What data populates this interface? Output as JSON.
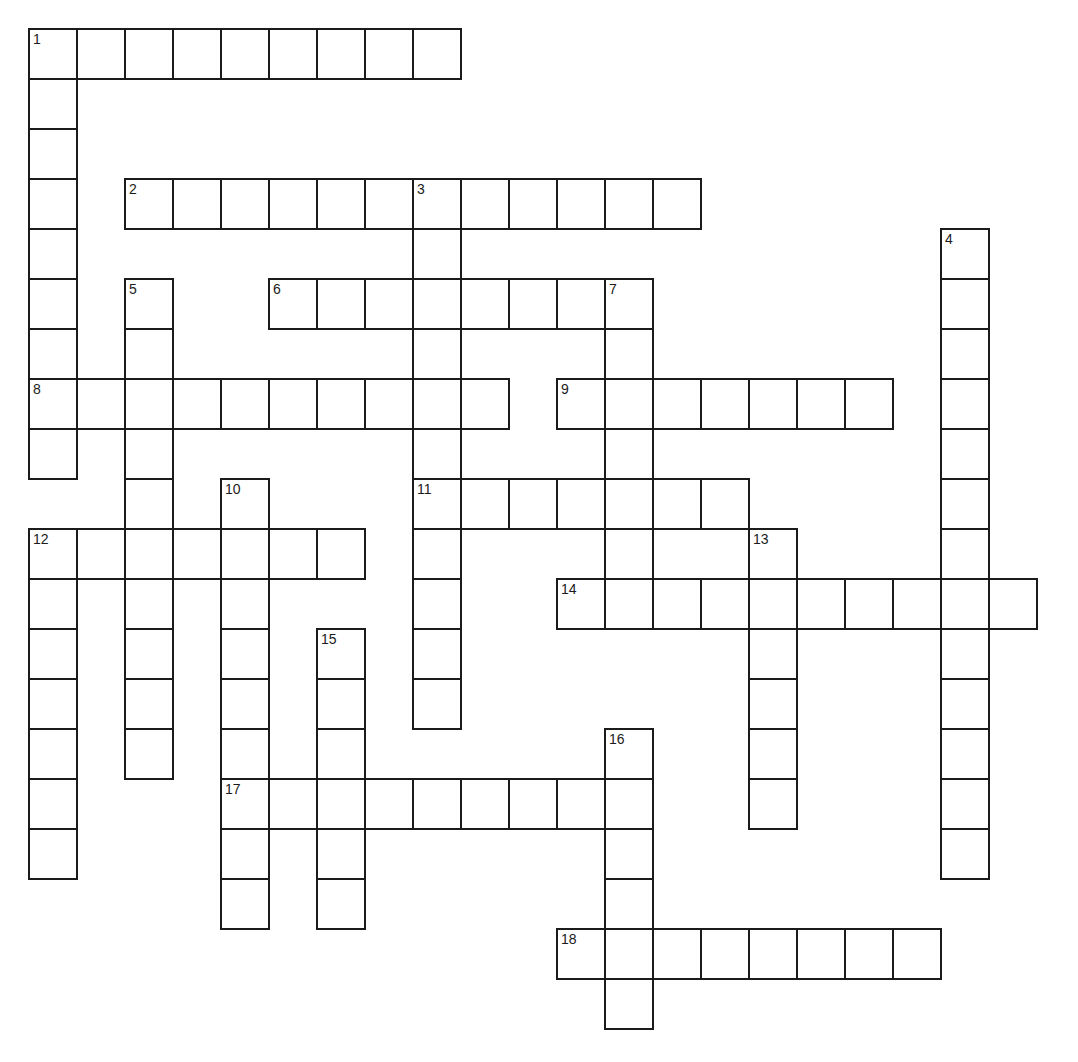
{
  "puzzle": {
    "kind": "crossword",
    "background": "#ffffff",
    "line_color": "#1b1b1b",
    "number_color": "#1b1b1b"
  },
  "grid": {
    "origin_x": 28,
    "origin_y": 28,
    "cell_width": 48,
    "cell_height": 50,
    "line_width": 2,
    "columns": 21,
    "rows": 20
  },
  "words": [
    {
      "num": 1,
      "dir": "across",
      "col": 0,
      "row": 0,
      "len": 9
    },
    {
      "num": 1,
      "dir": "down",
      "col": 0,
      "row": 0,
      "len": 9
    },
    {
      "num": 2,
      "dir": "across",
      "col": 2,
      "row": 3,
      "len": 12
    },
    {
      "num": 3,
      "dir": "down",
      "col": 8,
      "row": 3,
      "len": 6
    },
    {
      "num": 4,
      "dir": "down",
      "col": 19,
      "row": 4,
      "len": 13
    },
    {
      "num": 5,
      "dir": "down",
      "col": 2,
      "row": 5,
      "len": 10
    },
    {
      "num": 6,
      "dir": "across",
      "col": 5,
      "row": 5,
      "len": 8
    },
    {
      "num": 7,
      "dir": "down",
      "col": 12,
      "row": 5,
      "len": 7
    },
    {
      "num": 8,
      "dir": "across",
      "col": 0,
      "row": 7,
      "len": 10
    },
    {
      "num": 9,
      "dir": "across",
      "col": 11,
      "row": 7,
      "len": 7
    },
    {
      "num": 10,
      "dir": "down",
      "col": 4,
      "row": 9,
      "len": 9
    },
    {
      "num": 11,
      "dir": "across",
      "col": 8,
      "row": 9,
      "len": 7
    },
    {
      "num": 11,
      "dir": "down",
      "col": 8,
      "row": 9,
      "len": 5
    },
    {
      "num": 12,
      "dir": "across",
      "col": 0,
      "row": 10,
      "len": 7
    },
    {
      "num": 12,
      "dir": "down",
      "col": 0,
      "row": 10,
      "len": 7
    },
    {
      "num": 13,
      "dir": "down",
      "col": 15,
      "row": 10,
      "len": 6
    },
    {
      "num": 14,
      "dir": "across",
      "col": 11,
      "row": 11,
      "len": 10
    },
    {
      "num": 15,
      "dir": "down",
      "col": 6,
      "row": 12,
      "len": 6
    },
    {
      "num": 16,
      "dir": "down",
      "col": 12,
      "row": 14,
      "len": 6
    },
    {
      "num": 17,
      "dir": "across",
      "col": 4,
      "row": 15,
      "len": 9
    },
    {
      "num": 18,
      "dir": "across",
      "col": 11,
      "row": 18,
      "len": 8
    }
  ],
  "numbers": [
    {
      "label": "1",
      "col": 0,
      "row": 0
    },
    {
      "label": "2",
      "col": 2,
      "row": 3
    },
    {
      "label": "3",
      "col": 8,
      "row": 3
    },
    {
      "label": "4",
      "col": 19,
      "row": 4
    },
    {
      "label": "5",
      "col": 2,
      "row": 5
    },
    {
      "label": "6",
      "col": 5,
      "row": 5
    },
    {
      "label": "7",
      "col": 12,
      "row": 5
    },
    {
      "label": "8",
      "col": 0,
      "row": 7
    },
    {
      "label": "9",
      "col": 11,
      "row": 7
    },
    {
      "label": "10",
      "col": 4,
      "row": 9
    },
    {
      "label": "11",
      "col": 8,
      "row": 9
    },
    {
      "label": "12",
      "col": 0,
      "row": 10
    },
    {
      "label": "13",
      "col": 15,
      "row": 10
    },
    {
      "label": "14",
      "col": 11,
      "row": 11
    },
    {
      "label": "15",
      "col": 6,
      "row": 12
    },
    {
      "label": "16",
      "col": 12,
      "row": 14
    },
    {
      "label": "17",
      "col": 4,
      "row": 15
    },
    {
      "label": "18",
      "col": 11,
      "row": 18
    }
  ]
}
